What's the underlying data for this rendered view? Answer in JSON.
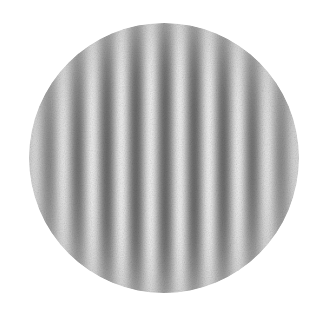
{
  "image": {
    "kind": "gabor-patch",
    "description": "Vertical sine-wave luminance grating windowed by a circular aperture",
    "background_color": "#ffffff",
    "canvas_width": 316,
    "canvas_height": 312
  },
  "aperture": {
    "shape": "circle",
    "center_x": 164,
    "center_y": 158,
    "radius": 135,
    "diameter": 270,
    "mean_luminance_color": "#c9c9c9",
    "edge_softness_px": 4
  },
  "grating": {
    "orientation": "vertical",
    "orientation_degrees": 90,
    "period_px": 29.2,
    "cycles_visible": 9,
    "phase_offset_px": 10,
    "peak_light_color": "#f2f2f2",
    "peak_dark_color": "#6e6e6e",
    "mid_color": "#c4c4c4",
    "michelson_contrast": 0.38,
    "dark_bar_centers_px": [
      68,
      97,
      126,
      155,
      185,
      214,
      243,
      272
    ],
    "light_bar_centers_px": [
      53,
      82,
      112,
      141,
      170,
      199,
      228,
      258
    ]
  },
  "envelope": {
    "type": "radial-gaussian",
    "full_contrast_radius_px": 62,
    "falloff_start_pct": 30,
    "falloff_end_pct": 100,
    "rim_color": "#c9c9c9"
  },
  "texture": {
    "grain": "paper-scan-noise",
    "grain_opacity": 0.3,
    "grain_frequency": 0.85
  }
}
